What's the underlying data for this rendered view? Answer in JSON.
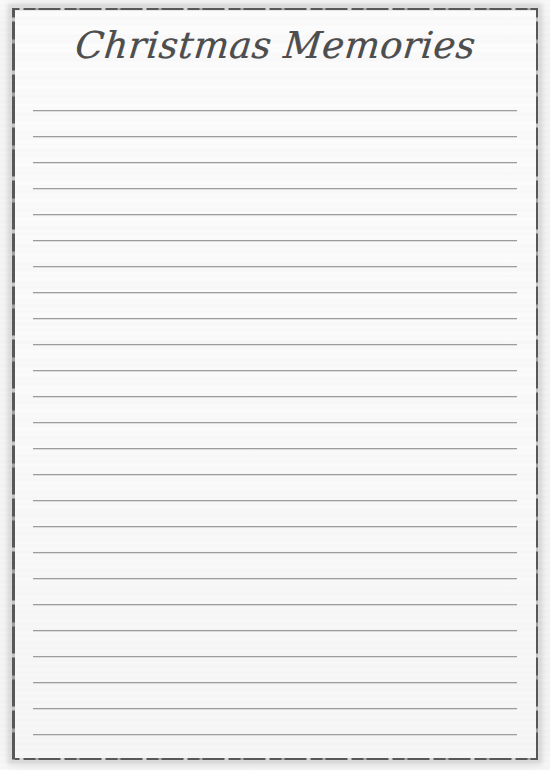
{
  "page": {
    "title": "Christmas Memories",
    "width": 550,
    "height": 770,
    "kind": "printable-lined-stationery"
  },
  "colors": {
    "paper": "#fdfdfd",
    "outer_margin": "#ebe9e9",
    "frame_stroke": "#585858",
    "rule_line": "#9d9d9d",
    "title_text": "#4e4e4e"
  },
  "frame": {
    "name": "distressed-border",
    "left": 12,
    "top": 8,
    "right": 538,
    "bottom": 760
  },
  "ruled_lines": {
    "count": 25,
    "first_y": 110,
    "spacing": 26,
    "x_start": 33,
    "x_end": 517,
    "positions": [
      110,
      136,
      162,
      188,
      214,
      240,
      266,
      292,
      318,
      344,
      370,
      396,
      422,
      448,
      474,
      500,
      526,
      552,
      578,
      604,
      630,
      656,
      682,
      708,
      734
    ]
  }
}
